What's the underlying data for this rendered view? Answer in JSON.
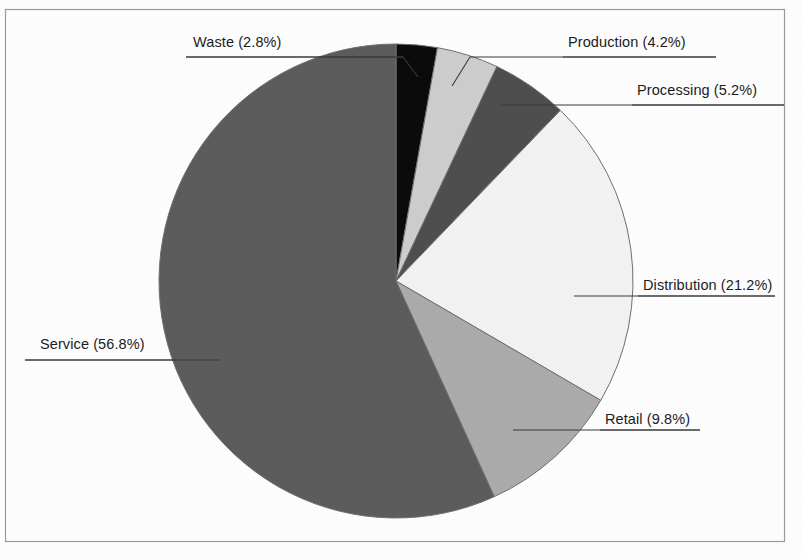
{
  "figure": {
    "background_color": "#fdfdfd",
    "frame_color": "#9a9a9a",
    "frame": {
      "x": 5,
      "y": 9,
      "width": 779,
      "height": 532
    }
  },
  "chart_data": {
    "type": "pie",
    "title": "",
    "subtitle": "",
    "xlabel": "",
    "ylabel": "",
    "legend_position": "none",
    "grid": false,
    "labels_show_percent": true,
    "start_angle_deg": 0,
    "direction": "clockwise",
    "center": {
      "x": 396,
      "y": 281
    },
    "radius": 237,
    "categories": [
      "Waste",
      "Production",
      "Processing",
      "Distribution",
      "Retail",
      "Service"
    ],
    "values": [
      2.8,
      4.2,
      5.2,
      21.2,
      9.8,
      56.8
    ],
    "total": 100.0,
    "units": "percent",
    "colors": [
      "#0b0b0b",
      "#cdcdcd",
      "#4e4e4e",
      "#f2f2f2",
      "#ababab",
      "#5c5c5c"
    ],
    "slice_edge_color": "#6f6f6f",
    "slices": [
      {
        "name": "Waste",
        "value": 2.8,
        "label": "Waste (2.8%)",
        "color": "#0b0b0b",
        "start_angle_deg": 0.0,
        "end_angle_deg": 10.08,
        "label_x": 193,
        "label_y": 47,
        "label_anchor": "start"
      },
      {
        "name": "Production",
        "value": 4.2,
        "label": "Production (4.2%)",
        "color": "#cdcdcd",
        "start_angle_deg": 10.08,
        "end_angle_deg": 25.2,
        "label_x": 568,
        "label_y": 47,
        "label_anchor": "start"
      },
      {
        "name": "Processing",
        "value": 5.2,
        "label": "Processing (5.2%)",
        "color": "#4e4e4e",
        "start_angle_deg": 25.2,
        "end_angle_deg": 43.92,
        "label_x": 637,
        "label_y": 95,
        "label_anchor": "start"
      },
      {
        "name": "Distribution",
        "value": 21.2,
        "label": "Distribution (21.2%)",
        "color": "#f2f2f2",
        "start_angle_deg": 43.92,
        "end_angle_deg": 120.24,
        "label_x": 643,
        "label_y": 290,
        "label_anchor": "start"
      },
      {
        "name": "Retail",
        "value": 9.8,
        "label": "Retail (9.8%)",
        "color": "#ababab",
        "start_angle_deg": 120.24,
        "end_angle_deg": 155.52,
        "label_x": 605,
        "label_y": 424,
        "label_anchor": "start"
      },
      {
        "name": "Service",
        "value": 56.8,
        "label": "Service (56.8%)",
        "color": "#5c5c5c",
        "start_angle_deg": 155.52,
        "end_angle_deg": 360.0,
        "label_x": 40,
        "label_y": 349,
        "label_anchor": "start"
      }
    ],
    "leader_lines": [
      {
        "name": "waste",
        "points": "186,57 403,57 418,77"
      },
      {
        "name": "production",
        "points": "716,57 470,57 452,86"
      },
      {
        "name": "processing",
        "points": "784,105 500,105"
      },
      {
        "name": "distribution",
        "points": "775,296 574,296"
      },
      {
        "name": "retail",
        "points": "700,430 513,430"
      },
      {
        "name": "service",
        "points": "25,360 220,360"
      }
    ],
    "leader_color": "#3a3a3a",
    "label_underlines": [
      {
        "name": "waste",
        "x1": 186,
        "x2": 403,
        "y": 57
      },
      {
        "name": "production",
        "x1": 563,
        "x2": 716,
        "y": 57
      },
      {
        "name": "processing",
        "x1": 632,
        "x2": 784,
        "y": 105
      },
      {
        "name": "distribution",
        "x1": 638,
        "x2": 775,
        "y": 296
      },
      {
        "name": "retail",
        "x1": 600,
        "x2": 700,
        "y": 430
      },
      {
        "name": "service",
        "x1": 25,
        "x2": 176,
        "y": 360
      }
    ]
  }
}
